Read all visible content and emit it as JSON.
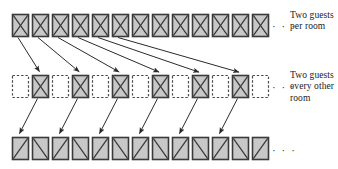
{
  "figure": {
    "width": 338,
    "height": 169,
    "background": "#ffffff",
    "ink_color": "#2a2a2a",
    "box_fill": "#c8c8c8",
    "box_stroke": "#3a3a3a",
    "dashed_stroke": "#4a4a4a"
  },
  "rows": [
    {
      "id": "row-top",
      "name": "top-row",
      "y": 14,
      "x_start": 12,
      "pitch": 20,
      "box_w": 16,
      "box_h": 22,
      "count": 13,
      "ellipsis": "· · ·",
      "boxes": [
        {
          "style": "solid",
          "mark": "x"
        },
        {
          "style": "solid",
          "mark": "x"
        },
        {
          "style": "solid",
          "mark": "x"
        },
        {
          "style": "solid",
          "mark": "x"
        },
        {
          "style": "solid",
          "mark": "x"
        },
        {
          "style": "solid",
          "mark": "x"
        },
        {
          "style": "solid",
          "mark": "x"
        },
        {
          "style": "solid",
          "mark": "x"
        },
        {
          "style": "solid",
          "mark": "x"
        },
        {
          "style": "solid",
          "mark": "x"
        },
        {
          "style": "solid",
          "mark": "x"
        },
        {
          "style": "solid",
          "mark": "x"
        },
        {
          "style": "solid",
          "mark": "x"
        }
      ],
      "label": {
        "lines": [
          "Two guests",
          "per room"
        ]
      }
    },
    {
      "id": "row-mid",
      "name": "middle-row",
      "y": 75,
      "x_start": 12,
      "pitch": 20,
      "box_w": 16,
      "box_h": 22,
      "count": 13,
      "ellipsis": "· · ·",
      "boxes": [
        {
          "style": "dashed",
          "mark": "none"
        },
        {
          "style": "solid",
          "mark": "x"
        },
        {
          "style": "dashed",
          "mark": "none"
        },
        {
          "style": "solid",
          "mark": "x"
        },
        {
          "style": "dashed",
          "mark": "none"
        },
        {
          "style": "solid",
          "mark": "x"
        },
        {
          "style": "dashed",
          "mark": "none"
        },
        {
          "style": "solid",
          "mark": "x"
        },
        {
          "style": "dashed",
          "mark": "none"
        },
        {
          "style": "solid",
          "mark": "x"
        },
        {
          "style": "dashed",
          "mark": "none"
        },
        {
          "style": "solid",
          "mark": "x"
        },
        {
          "style": "dashed",
          "mark": "none"
        }
      ],
      "label": {
        "lines": [
          "Two guests",
          "every other",
          "room"
        ]
      }
    },
    {
      "id": "row-bot",
      "name": "bottom-row",
      "y": 137,
      "x_start": 12,
      "pitch": 20,
      "box_w": 16,
      "box_h": 22,
      "count": 13,
      "ellipsis": "· · ·",
      "boxes": [
        {
          "style": "solid",
          "mark": "slash"
        },
        {
          "style": "solid",
          "mark": "backslash"
        },
        {
          "style": "solid",
          "mark": "slash"
        },
        {
          "style": "solid",
          "mark": "backslash"
        },
        {
          "style": "solid",
          "mark": "slash"
        },
        {
          "style": "solid",
          "mark": "backslash"
        },
        {
          "style": "solid",
          "mark": "slash"
        },
        {
          "style": "solid",
          "mark": "backslash"
        },
        {
          "style": "solid",
          "mark": "slash"
        },
        {
          "style": "solid",
          "mark": "backslash"
        },
        {
          "style": "solid",
          "mark": "slash"
        },
        {
          "style": "solid",
          "mark": "backslash"
        },
        {
          "style": "solid",
          "mark": "slash"
        }
      ],
      "label": {
        "lines": []
      }
    }
  ],
  "arrows": {
    "fan": {
      "name": "top-to-middle-arrows",
      "count": 6,
      "from_row": "row-top",
      "to_row": "row-mid",
      "pairs": [
        {
          "from_box": 0,
          "to_box": 1
        },
        {
          "from_box": 1,
          "to_box": 3
        },
        {
          "from_box": 2,
          "to_box": 5
        },
        {
          "from_box": 3,
          "to_box": 7
        },
        {
          "from_box": 4,
          "to_box": 9
        },
        {
          "from_box": 5,
          "to_box": 11
        }
      ]
    },
    "short": {
      "name": "middle-to-bottom-arrows",
      "count": 6,
      "from_row": "row-mid",
      "to_row": "row-bot",
      "pairs": [
        {
          "from_box": 1,
          "to_box": 0
        },
        {
          "from_box": 3,
          "to_box": 2
        },
        {
          "from_box": 5,
          "to_box": 4
        },
        {
          "from_box": 7,
          "to_box": 6
        },
        {
          "from_box": 9,
          "to_box": 8
        },
        {
          "from_box": 11,
          "to_box": 10
        }
      ]
    }
  },
  "labels": {
    "top": {
      "line1": "Two guests",
      "line2": "per room"
    },
    "middle": {
      "line1": "Two guests",
      "line2": "every other",
      "line3": "room"
    }
  },
  "ellipses": {
    "top": "· · ·",
    "middle": "· · ·",
    "bottom": "· · ·"
  }
}
